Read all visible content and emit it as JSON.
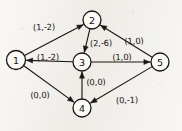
{
  "figure": {
    "kind": "directed-graph-diagram",
    "background_color": "#f2f0ec",
    "ink_color": "#1a1713",
    "width": 182,
    "height": 131
  },
  "graph": {
    "nodes": [
      {
        "id": "1",
        "label": "1",
        "cx": 16,
        "cy": 60,
        "r": 9.5
      },
      {
        "id": "2",
        "label": "2",
        "cx": 92,
        "cy": 20,
        "r": 9.0
      },
      {
        "id": "3",
        "label": "3",
        "cx": 82,
        "cy": 62,
        "r": 9.0
      },
      {
        "id": "4",
        "label": "4",
        "cx": 82,
        "cy": 108,
        "r": 9.0
      },
      {
        "id": "5",
        "label": "5",
        "cx": 160,
        "cy": 62,
        "r": 9.0
      }
    ],
    "edges": [
      {
        "id": "e-1-2",
        "from": "1",
        "to": "2",
        "label": "(1,-2)",
        "label_x": 44,
        "label_y": 27
      },
      {
        "id": "e-2-3",
        "from": "2",
        "to": "3",
        "label": "(2,-6)",
        "label_x": 101,
        "label_y": 43
      },
      {
        "id": "e-5-2",
        "from": "5",
        "to": "2",
        "label": "(1,0)",
        "label_x": 134,
        "label_y": 41
      },
      {
        "id": "e-3-1",
        "from": "3",
        "to": "1",
        "label": "(1,-2)",
        "label_x": 48,
        "label_y": 57
      },
      {
        "id": "e-3-5",
        "from": "3",
        "to": "5",
        "label": "(1,0)",
        "label_x": 122,
        "label_y": 57
      },
      {
        "id": "e-4-3",
        "from": "4",
        "to": "3",
        "label": "(0,0)",
        "label_x": 96,
        "label_y": 82
      },
      {
        "id": "e-1-4",
        "from": "1",
        "to": "4",
        "label": "(0,0)",
        "label_x": 40,
        "label_y": 95
      },
      {
        "id": "e-5-4",
        "from": "5",
        "to": "4",
        "label": "(0,-1)",
        "label_x": 127,
        "label_y": 100
      }
    ]
  }
}
